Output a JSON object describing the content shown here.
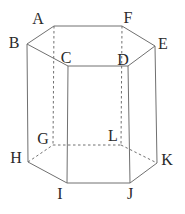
{
  "diagram": {
    "kind": "hexagonal-prism-wireframe",
    "canvas": {
      "width": 185,
      "height": 214,
      "background": "#ffffff"
    },
    "style": {
      "stroke_color": "#707070",
      "stroke_width": 1,
      "dash_pattern": "2.5 2.5",
      "label_color": "#2a2a2a",
      "label_font_size": 16
    },
    "vertex_names": [
      "A",
      "B",
      "C",
      "D",
      "E",
      "F",
      "G",
      "H",
      "I",
      "J",
      "K",
      "L"
    ],
    "vertices": {
      "A": [
        54,
        26
      ],
      "B": [
        27,
        44
      ],
      "C": [
        68,
        66
      ],
      "D": [
        128,
        66
      ],
      "E": [
        155,
        46
      ],
      "F": [
        122,
        26
      ],
      "G": [
        53,
        145
      ],
      "H": [
        28,
        162
      ],
      "I": [
        67,
        183
      ],
      "J": [
        130,
        183
      ],
      "K": [
        157,
        163
      ],
      "L": [
        121,
        145
      ]
    },
    "labels": {
      "A": [
        38,
        18
      ],
      "B": [
        14,
        42
      ],
      "C": [
        66,
        57
      ],
      "D": [
        123,
        59
      ],
      "E": [
        163,
        43
      ],
      "F": [
        128,
        17
      ],
      "G": [
        43,
        138
      ],
      "H": [
        16,
        157
      ],
      "I": [
        60,
        193
      ],
      "J": [
        130,
        193
      ],
      "K": [
        167,
        159
      ],
      "L": [
        113,
        135
      ]
    },
    "solid_edges": [
      [
        "B",
        "A"
      ],
      [
        "A",
        "F"
      ],
      [
        "F",
        "E"
      ],
      [
        "E",
        "D"
      ],
      [
        "D",
        "C"
      ],
      [
        "C",
        "B"
      ],
      [
        "B",
        "H"
      ],
      [
        "C",
        "I"
      ],
      [
        "D",
        "J"
      ],
      [
        "E",
        "K"
      ],
      [
        "H",
        "I"
      ],
      [
        "I",
        "J"
      ],
      [
        "J",
        "K"
      ]
    ],
    "dashed_edges": [
      [
        "A",
        "G"
      ],
      [
        "F",
        "L"
      ],
      [
        "H",
        "G"
      ],
      [
        "G",
        "L"
      ],
      [
        "L",
        "K"
      ]
    ]
  }
}
